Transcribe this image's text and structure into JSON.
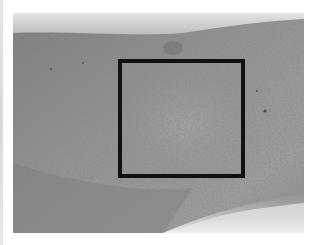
{
  "image": {
    "subject": "grayscale close-up photograph of skin with speckled lesion",
    "photo_bounds": {
      "x": 13,
      "y": 13,
      "width": 291,
      "height": 220
    },
    "colors": {
      "background": "#ffffff",
      "skin_mid": "#8e8e8e",
      "skin_dark": "#6f6f6f",
      "skin_light": "#a6a6a6",
      "highlight": "#e9e9e9",
      "roi_border": "#111111"
    }
  },
  "annotation": {
    "type": "rectangle",
    "label": "region of interest",
    "x": 118,
    "y": 59,
    "width": 127,
    "height": 119,
    "border_width": 4
  }
}
